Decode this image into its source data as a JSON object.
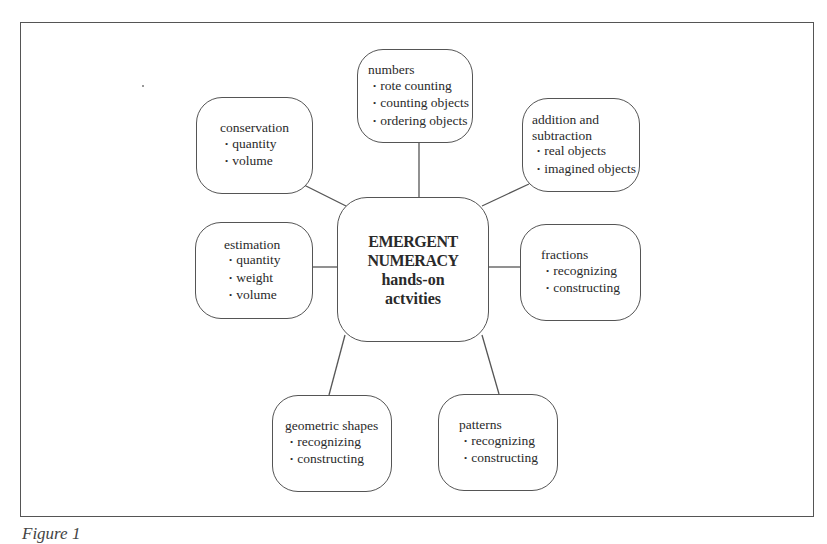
{
  "diagram": {
    "center": {
      "line1": "EMERGENT",
      "line2": "NUMERACY",
      "line3": "hands-on",
      "line4": "actvities"
    },
    "nodes": {
      "numbers": {
        "title": "numbers",
        "items": [
          "rote counting",
          "counting objects",
          "ordering objects"
        ]
      },
      "conservation": {
        "title": "conservation",
        "items": [
          "quantity",
          "volume"
        ]
      },
      "addition": {
        "title_line1": "addition and",
        "title_line2": "subtraction",
        "items": [
          "real objects",
          "imagined objects"
        ]
      },
      "estimation": {
        "title": "estimation",
        "items": [
          "quantity",
          "weight",
          "volume"
        ]
      },
      "fractions": {
        "title": "fractions",
        "items": [
          "recognizing",
          "constructing"
        ]
      },
      "geometric": {
        "title": "geometric shapes",
        "items": [
          "recognizing",
          "constructing"
        ]
      },
      "patterns": {
        "title": "patterns",
        "items": [
          "recognizing",
          "constructing"
        ]
      }
    },
    "caption": "Figure 1"
  }
}
